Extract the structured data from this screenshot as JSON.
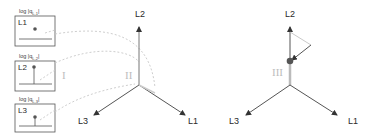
{
  "panels": [
    {
      "id": "L1",
      "label": "L1",
      "title": "log |q_L1|",
      "title_text": "log |q",
      "sub": "L,1"
    },
    {
      "id": "L2",
      "label": "L2",
      "title": "log |q_L2|",
      "title_text": "log |q",
      "sub": "L,2"
    },
    {
      "id": "L3",
      "label": "L3",
      "title": "log |q_L3|",
      "title_text": "log |q",
      "sub": "L,3"
    }
  ],
  "regions": {
    "I": "I",
    "II": "II",
    "III": "III"
  },
  "left_axes": {
    "up": "L2",
    "down_left": "L3",
    "down_right": "L1"
  },
  "right_axes": {
    "up": "L2",
    "down_left": "L3",
    "down_right": "L1"
  },
  "colors": {
    "axis": "#444444",
    "dashed": "#c8c8c8",
    "dot": "#555555",
    "roman": "#bdbdbd",
    "box_border": "#555555"
  }
}
